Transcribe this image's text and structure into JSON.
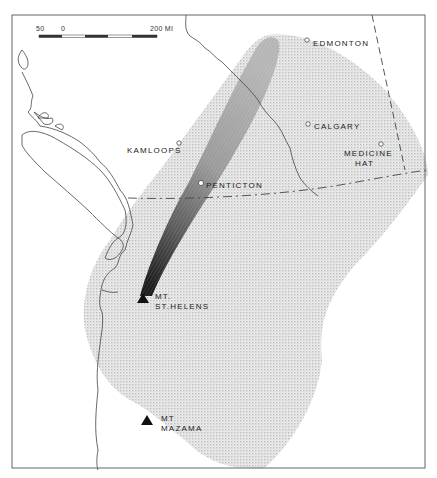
{
  "scale_bar": {
    "labels": {
      "left": "50",
      "zero": "0",
      "right": "200 MI"
    }
  },
  "cities": [
    {
      "name": "EDMONTON",
      "x": 307,
      "y": 40
    },
    {
      "name": "CALGARY",
      "x": 308,
      "y": 124
    },
    {
      "name": "MEDICINE",
      "name2": "HAT",
      "x": 381,
      "y": 144
    },
    {
      "name": "KAMLOOPS",
      "x": 178,
      "y": 144
    },
    {
      "name": "PENTICTON",
      "x": 201,
      "y": 183
    }
  ],
  "volcanoes": [
    {
      "line1": "MT.",
      "line2": "ST.HELENS",
      "x": 143,
      "y": 298
    },
    {
      "line1": "MT",
      "line2": "MAZAMA",
      "x": 147,
      "y": 419
    }
  ],
  "colors": {
    "frame": "#555555",
    "coast": "#444444",
    "ash_light": "#e2e2e2",
    "plume_dark": "#2a2a2a",
    "volcano": "#111111"
  }
}
